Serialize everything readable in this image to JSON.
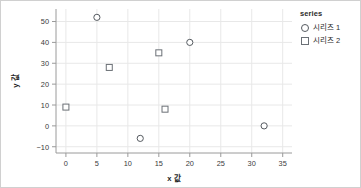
{
  "chart_data": {
    "type": "scatter",
    "title": "",
    "xlabel": "x 값",
    "ylabel": "y 값",
    "xlim": [
      -1.6,
      36.5
    ],
    "ylim": [
      -13,
      56
    ],
    "xticks": [
      0,
      5,
      10,
      15,
      20,
      25,
      30,
      35
    ],
    "yticks": [
      -10,
      0,
      10,
      20,
      30,
      40,
      50
    ],
    "xtick_labels": [
      "0",
      "5",
      "10",
      "15",
      "20",
      "25",
      "30",
      "35"
    ],
    "ytick_labels": [
      "−10",
      "0",
      "10",
      "20",
      "30",
      "40",
      "50"
    ],
    "grid": true,
    "grid_color": "#e8e8e8",
    "legend_position": "right",
    "legend_title": "series",
    "series": [
      {
        "name": "시리즈 1",
        "marker": "circle",
        "color": "#555a60",
        "points": [
          {
            "x": 5,
            "y": 52
          },
          {
            "x": 20,
            "y": 40
          },
          {
            "x": 12,
            "y": -6
          },
          {
            "x": 32,
            "y": 0
          }
        ]
      },
      {
        "name": "시리즈 2",
        "marker": "square",
        "color": "#6b7076",
        "points": [
          {
            "x": 0,
            "y": 9
          },
          {
            "x": 7,
            "y": 28
          },
          {
            "x": 15,
            "y": 35
          },
          {
            "x": 16,
            "y": 8
          }
        ]
      }
    ]
  },
  "legend": {
    "title": "series",
    "entries": [
      {
        "label": "시리즈 1",
        "marker": "circle"
      },
      {
        "label": "시리즈 2",
        "marker": "square"
      }
    ]
  },
  "axes": {
    "x_title": "x 값",
    "y_title": "y 값"
  }
}
